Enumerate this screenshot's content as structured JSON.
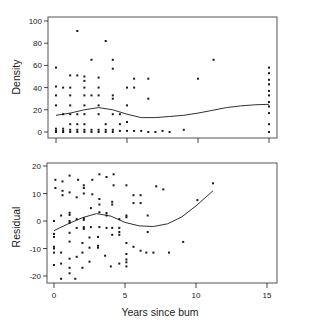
{
  "chart_data": [
    {
      "type": "scatter",
      "panel": "top",
      "title": "",
      "xlabel": "",
      "ylabel": "Density",
      "xlim": [
        0,
        15
      ],
      "ylim": [
        0,
        100
      ],
      "xticks": [
        0,
        5,
        10,
        15
      ],
      "xtick_labels": [],
      "yticks": [
        0,
        20,
        40,
        60,
        80,
        100
      ],
      "ytick_labels": [
        "0",
        "20",
        "40",
        "60",
        "80",
        "100"
      ],
      "grid": false,
      "legend": null,
      "points": [
        [
          0.0,
          58
        ],
        [
          0.0,
          41
        ],
        [
          0.0,
          33
        ],
        [
          0.0,
          24
        ],
        [
          0.0,
          3
        ],
        [
          0.0,
          1
        ],
        [
          0.0,
          0
        ],
        [
          0.5,
          40
        ],
        [
          0.5,
          16
        ],
        [
          0.5,
          3
        ],
        [
          0.5,
          1
        ],
        [
          0.5,
          0
        ],
        [
          1.0,
          51
        ],
        [
          1.0,
          40
        ],
        [
          1.0,
          33
        ],
        [
          1.0,
          24
        ],
        [
          1.0,
          16
        ],
        [
          1.0,
          7
        ],
        [
          1.0,
          2
        ],
        [
          1.0,
          0
        ],
        [
          1.5,
          91
        ],
        [
          1.5,
          51
        ],
        [
          1.5,
          16
        ],
        [
          1.5,
          7
        ],
        [
          1.5,
          2
        ],
        [
          1.5,
          0
        ],
        [
          2.0,
          50
        ],
        [
          2.0,
          46
        ],
        [
          2.0,
          40
        ],
        [
          2.0,
          33
        ],
        [
          2.0,
          24
        ],
        [
          2.0,
          16
        ],
        [
          2.0,
          7
        ],
        [
          2.0,
          2
        ],
        [
          2.0,
          0
        ],
        [
          2.5,
          65
        ],
        [
          2.5,
          33
        ],
        [
          2.5,
          2
        ],
        [
          2.5,
          0
        ],
        [
          3.0,
          49
        ],
        [
          3.0,
          40
        ],
        [
          3.0,
          33
        ],
        [
          3.0,
          24
        ],
        [
          3.0,
          16
        ],
        [
          3.0,
          2
        ],
        [
          3.0,
          0
        ],
        [
          3.5,
          82
        ],
        [
          3.5,
          7
        ],
        [
          3.5,
          2
        ],
        [
          3.5,
          0
        ],
        [
          4.0,
          65
        ],
        [
          4.0,
          57
        ],
        [
          4.0,
          33
        ],
        [
          4.0,
          30
        ],
        [
          4.0,
          16
        ],
        [
          4.0,
          2
        ],
        [
          4.0,
          0
        ],
        [
          4.5,
          16
        ],
        [
          4.5,
          7
        ],
        [
          4.5,
          1
        ],
        [
          5.0,
          40
        ],
        [
          5.0,
          24
        ],
        [
          5.0,
          9
        ],
        [
          5.0,
          1
        ],
        [
          5.5,
          48
        ],
        [
          5.5,
          40
        ],
        [
          5.5,
          1
        ],
        [
          6.0,
          1
        ],
        [
          6.5,
          48
        ],
        [
          6.5,
          30
        ],
        [
          6.5,
          0
        ],
        [
          7.0,
          0
        ],
        [
          7.5,
          1
        ],
        [
          8.0,
          0
        ],
        [
          9.0,
          2
        ],
        [
          10.0,
          48
        ],
        [
          11.1,
          65
        ],
        [
          15.0,
          58
        ],
        [
          15.0,
          53
        ],
        [
          15.0,
          47
        ],
        [
          15.0,
          43
        ],
        [
          15.0,
          37
        ],
        [
          15.0,
          33
        ],
        [
          15.0,
          27
        ],
        [
          15.0,
          23
        ],
        [
          15.0,
          17
        ],
        [
          15.0,
          7
        ],
        [
          15.0,
          0
        ]
      ],
      "smooth_curve": [
        [
          0,
          15
        ],
        [
          1,
          17
        ],
        [
          2,
          20
        ],
        [
          3,
          22
        ],
        [
          4,
          20
        ],
        [
          5,
          16
        ],
        [
          6,
          13
        ],
        [
          7,
          13
        ],
        [
          8,
          14
        ],
        [
          9,
          15
        ],
        [
          10,
          17
        ],
        [
          11,
          19.5
        ],
        [
          12,
          22
        ],
        [
          13,
          23.5
        ],
        [
          14,
          24.5
        ],
        [
          15,
          25
        ]
      ]
    },
    {
      "type": "scatter",
      "panel": "bottom",
      "title": "",
      "xlabel": "Years since bum",
      "ylabel": "Residual",
      "xlim": [
        0,
        15
      ],
      "ylim": [
        -20,
        20
      ],
      "xticks": [
        0,
        5,
        10,
        15
      ],
      "xtick_labels": [
        "0",
        "5",
        "10",
        "15"
      ],
      "yticks": [
        -20,
        -10,
        0,
        10,
        20
      ],
      "ytick_labels": [
        "-20",
        "-10",
        "0",
        "10",
        "20"
      ],
      "grid": false,
      "legend": null,
      "points": [
        [
          0.1,
          15
        ],
        [
          0.1,
          12
        ],
        [
          0.0,
          0
        ],
        [
          0.0,
          -4.7
        ],
        [
          0.0,
          -5.8
        ],
        [
          0.0,
          -9.4
        ],
        [
          0.0,
          -10
        ],
        [
          0.0,
          -11.5
        ],
        [
          0.0,
          -16
        ],
        [
          0.6,
          14.4
        ],
        [
          0.6,
          11
        ],
        [
          0.6,
          9.4
        ],
        [
          0.5,
          2
        ],
        [
          0.5,
          -11.5
        ],
        [
          0.5,
          -15.5
        ],
        [
          0.5,
          -21
        ],
        [
          1.1,
          16.5
        ],
        [
          1.1,
          10.4
        ],
        [
          1.1,
          3
        ],
        [
          1.1,
          2.2
        ],
        [
          1.1,
          0
        ],
        [
          1.1,
          -0.7
        ],
        [
          1.1,
          -4.3
        ],
        [
          1.1,
          -7.5
        ],
        [
          1.1,
          -13.7
        ],
        [
          1.1,
          -17
        ],
        [
          1.1,
          -19
        ],
        [
          1.7,
          15
        ],
        [
          1.6,
          8.6
        ],
        [
          1.6,
          0.7
        ],
        [
          1.6,
          -2.5
        ],
        [
          1.6,
          -13
        ],
        [
          1.5,
          -21
        ],
        [
          2.1,
          13
        ],
        [
          2.1,
          12
        ],
        [
          2.1,
          10
        ],
        [
          2.1,
          1.1
        ],
        [
          2.1,
          0.4
        ],
        [
          2.1,
          -2.2
        ],
        [
          2.1,
          -2.9
        ],
        [
          2.0,
          -8
        ],
        [
          2.0,
          -11.5
        ],
        [
          2.0,
          -17
        ],
        [
          2.7,
          15
        ],
        [
          2.7,
          9.7
        ],
        [
          2.6,
          4.7
        ],
        [
          2.6,
          -2.2
        ],
        [
          2.5,
          -6
        ],
        [
          2.5,
          -9.7
        ],
        [
          2.5,
          -14.8
        ],
        [
          3.2,
          17
        ],
        [
          3.2,
          8
        ],
        [
          3.2,
          6
        ],
        [
          3.2,
          3.2
        ],
        [
          3.2,
          -2.2
        ],
        [
          3.1,
          -5.8
        ],
        [
          3.1,
          -9
        ],
        [
          3.1,
          -9.7
        ],
        [
          3.7,
          16
        ],
        [
          3.7,
          2.9
        ],
        [
          3.7,
          2
        ],
        [
          3.7,
          -2.5
        ],
        [
          3.6,
          -12.6
        ],
        [
          4.2,
          17
        ],
        [
          4.2,
          13
        ],
        [
          4.1,
          7
        ],
        [
          4.1,
          6
        ],
        [
          4.1,
          -2.5
        ],
        [
          4.1,
          -5
        ],
        [
          4.0,
          -16.5
        ],
        [
          4.6,
          0.7
        ],
        [
          4.6,
          -2.5
        ],
        [
          4.6,
          -4
        ],
        [
          4.6,
          -5
        ],
        [
          4.6,
          -15.5
        ],
        [
          5.1,
          13
        ],
        [
          5.1,
          2
        ],
        [
          5.1,
          1.4
        ],
        [
          5.1,
          -8
        ],
        [
          5.1,
          -12
        ],
        [
          5.1,
          -14
        ],
        [
          5.1,
          -15
        ],
        [
          5.1,
          -16.5
        ],
        [
          5.6,
          9.4
        ],
        [
          5.6,
          6.5
        ],
        [
          5.6,
          -9.4
        ],
        [
          6.1,
          9.4
        ],
        [
          6.1,
          6.5
        ],
        [
          6.1,
          -10.8
        ],
        [
          6.6,
          2
        ],
        [
          6.6,
          -4
        ],
        [
          6.5,
          -11.5
        ],
        [
          7.2,
          12.6
        ],
        [
          7.0,
          -11.5
        ],
        [
          7.7,
          11.5
        ],
        [
          8.1,
          -11.5
        ],
        [
          9.1,
          -7.6
        ],
        [
          10.1,
          7.6
        ],
        [
          11.2,
          13.7
        ]
      ],
      "smooth_curve": [
        [
          0,
          -3.5
        ],
        [
          1,
          -1
        ],
        [
          2,
          1.2
        ],
        [
          3,
          2.7
        ],
        [
          4,
          1.8
        ],
        [
          5,
          -0.5
        ],
        [
          6,
          -1.8
        ],
        [
          7,
          -2
        ],
        [
          8,
          -1
        ],
        [
          9,
          1.5
        ],
        [
          10,
          5.5
        ],
        [
          11.2,
          11
        ]
      ]
    }
  ],
  "figure": {
    "panels": {
      "top": {
        "left": 48,
        "top": 17,
        "right": 277,
        "bottom": 138,
        "x0_px": 56,
        "x15_px": 269,
        "y0_px": 132,
        "ymax_px": 21
      },
      "bottom": {
        "left": 47,
        "top": 163,
        "right": 277,
        "bottom": 283,
        "x0_px": 54,
        "x15_px": 267,
        "y0_px": 221,
        "y20_px": 166
      }
    },
    "colors": {
      "ink": "#1a1a1a",
      "frame": "#555555",
      "background": "#ffffff"
    }
  }
}
